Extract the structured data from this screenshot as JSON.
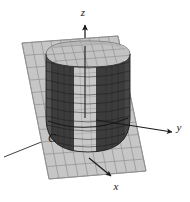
{
  "figure": {
    "kind": "3d-solid-diagram",
    "background_color": "#ffffff",
    "width": 190,
    "height": 202
  },
  "axes": {
    "z": {
      "label": "z",
      "icon": "arrow-up-icon",
      "label_x": 83,
      "label_y": 16,
      "color": "#1a1a1a"
    },
    "y": {
      "label": "y",
      "icon": "arrow-right-icon",
      "label_x": 179,
      "label_y": 131,
      "color": "#1a1a1a"
    },
    "x": {
      "label": "x",
      "icon": "arrow-down-right-icon",
      "label_x": 116,
      "label_y": 190,
      "color": "#1a1a1a"
    }
  },
  "curve": {
    "label": "C",
    "label_x": 52,
    "label_y": 142,
    "color": "#141414"
  },
  "plane": {
    "name": "grid-plane",
    "fill_color": "#c6c6c6",
    "grid_color": "#8d8d8d",
    "corners": [
      [
        22,
        43
      ],
      [
        118,
        36
      ],
      [
        146,
        171
      ],
      [
        49,
        179
      ]
    ],
    "grid_divisions_u": 10,
    "grid_divisions_v": 11
  },
  "cylinder": {
    "name": "shaded-cylinder",
    "dark_color": "#3c3c3c",
    "mid_color": "#555555",
    "light_color": "#c9c9c9",
    "edge_color": "#2a2a2a",
    "rim_color": "#6e6e6e",
    "center_x": 88,
    "top_y": 54,
    "bottom_y": 131,
    "radius_x": 42,
    "radius_y": 13,
    "ring_count": 9,
    "rib_count": 14
  }
}
